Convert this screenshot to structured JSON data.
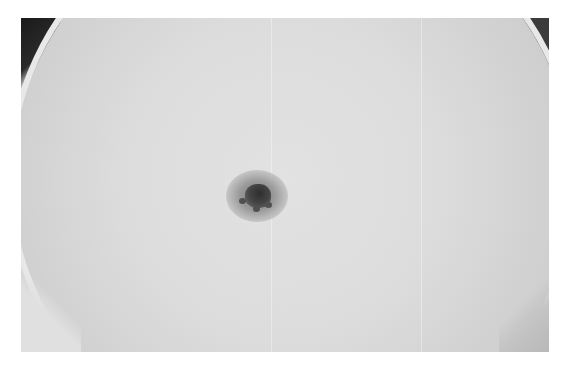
{
  "image": {
    "description": "Grayscale photograph of the solar disk with a single sunspot group near the center",
    "alt": "Sunspot on solar disk",
    "colors": {
      "background": "#ffffff",
      "disk": "#d8d8d8",
      "corner_dark": "#1a1a1a",
      "sunspot_umbra": "#2e2e2e",
      "sunspot_penumbra": "#8a8a8a"
    }
  }
}
